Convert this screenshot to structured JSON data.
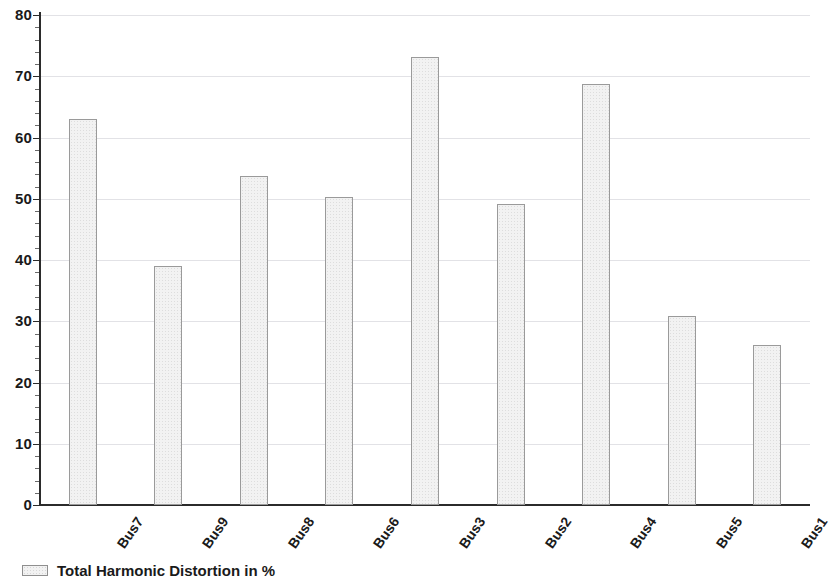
{
  "chart_data": {
    "type": "bar",
    "title": "",
    "xlabel": "",
    "ylabel": "",
    "categories": [
      "Bus7",
      "Bus9",
      "Bus8",
      "Bus6",
      "Bus3",
      "Bus2",
      "Bus4",
      "Bus5",
      "Bus1"
    ],
    "values": [
      63,
      39,
      53.7,
      50.3,
      73.2,
      49.2,
      68.7,
      30.8,
      26.2
    ],
    "series": [
      {
        "name": "Total Harmonic Distortion in %",
        "values": [
          63,
          39,
          53.7,
          50.3,
          73.2,
          49.2,
          68.7,
          30.8,
          26.2
        ]
      }
    ],
    "ylim": [
      0,
      80
    ],
    "ytick_labels": [
      "0",
      "10",
      "20",
      "30",
      "40",
      "50",
      "60",
      "70",
      "80"
    ],
    "ytick_values": [
      0,
      10,
      20,
      30,
      40,
      50,
      60,
      70,
      80
    ],
    "yminor_step": 2,
    "grid": true,
    "grid_axis": "y",
    "legend_position": "bottom-left",
    "legend": [
      "Total Harmonic Distortion in %"
    ],
    "bar_fill_color": "#f2f2f2",
    "bar_border_color": "#9a9a9a",
    "gridline_color": "#e2e2e6",
    "axis_color": "#2b2b2b"
  },
  "legend": {
    "entry_label": "Total Harmonic Distortion in %"
  }
}
